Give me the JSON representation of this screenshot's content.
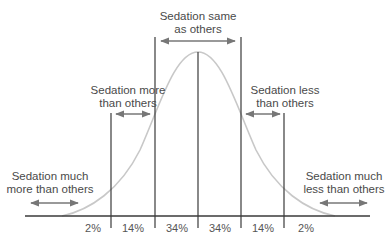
{
  "diagram": {
    "type": "normal-distribution",
    "colors": {
      "curve": "#c8c8c8",
      "lines": "#3a3a3a",
      "arrows": "#777777",
      "text": "#4a4a4a"
    },
    "labels": {
      "same": {
        "line1": "Sedation same",
        "line2": "as others"
      },
      "more": {
        "line1": "Sedation more",
        "line2": "than others"
      },
      "less": {
        "line1": "Sedation less",
        "line2": "than others"
      },
      "much_more": {
        "line1": "Sedation much",
        "line2": "more than others"
      },
      "much_less": {
        "line1": "Sedation much",
        "line2": "less than others"
      }
    },
    "percentages": [
      "2%",
      "14%",
      "34%",
      "34%",
      "14%",
      "2%"
    ]
  }
}
